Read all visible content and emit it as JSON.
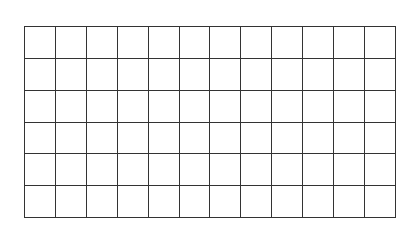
{
  "grid": {
    "rows": 6,
    "columns": 12,
    "line_color": "#333333",
    "background": "#ffffff"
  }
}
